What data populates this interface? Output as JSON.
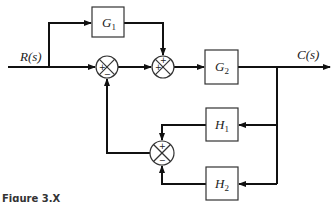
{
  "diagram": {
    "input_label": "R(s)",
    "output_label": "C(s)",
    "blocks": {
      "g1": {
        "name": "G",
        "sub": "1"
      },
      "g2": {
        "name": "G",
        "sub": "2"
      },
      "h1": {
        "name": "H",
        "sub": "1"
      },
      "h2": {
        "name": "H",
        "sub": "2"
      }
    },
    "junctions": {
      "sum1": {
        "signs": [
          "+",
          "−"
        ],
        "sign_positions": [
          "left",
          "bottom"
        ]
      },
      "sum2": {
        "signs": [
          "+",
          "+"
        ],
        "sign_positions": [
          "top",
          "left"
        ]
      },
      "sum3": {
        "signs": [
          "+",
          "−"
        ],
        "sign_positions": [
          "top",
          "bottom"
        ]
      }
    },
    "caption": "Figure 3.X"
  },
  "colors": {
    "line": "#111111",
    "background": "#ffffff"
  }
}
